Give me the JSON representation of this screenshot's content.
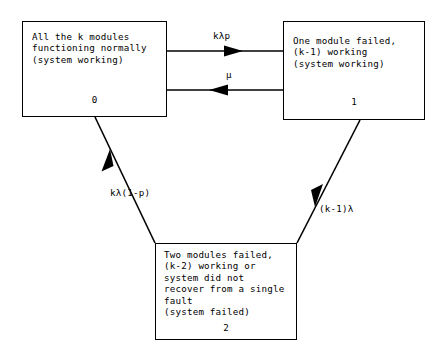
{
  "diagram": {
    "background_color": "#ffffff",
    "stroke_color": "#000000",
    "states": [
      {
        "id": "0",
        "name": "all-modules-working",
        "text": "All the k modules\nfunctioning normally\n(system working)"
      },
      {
        "id": "1",
        "name": "one-module-failed",
        "text": "One module failed,\n(k-1) working\n(system working)"
      },
      {
        "id": "2",
        "name": "two-modules-failed",
        "text": "Two modules failed,\n(k-2) working or\nsystem did not\nrecover from a single\nfault\n(system failed)"
      }
    ],
    "transitions": [
      {
        "name": "state0-to-state1",
        "from": "0",
        "to": "1",
        "label": "kλp",
        "direction": "right"
      },
      {
        "name": "state1-to-state0",
        "from": "1",
        "to": "0",
        "label": "μ",
        "direction": "left"
      },
      {
        "name": "state0-to-state2",
        "from": "0",
        "to": "2",
        "label": "kλ(1-p)",
        "direction": "down-right"
      },
      {
        "name": "state1-to-state2",
        "from": "1",
        "to": "2",
        "label": "(k-1)λ",
        "direction": "down-left"
      }
    ]
  }
}
